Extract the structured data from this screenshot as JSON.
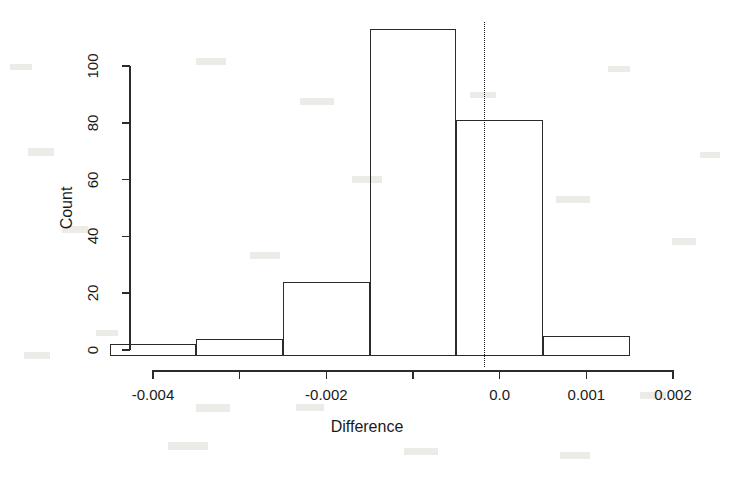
{
  "chart_data": {
    "type": "bar",
    "title": "",
    "xlabel": "Difference",
    "ylabel": "Count",
    "grid": false,
    "legend": "none",
    "xlim": [
      -0.0045,
      0.0025
    ],
    "ylim": [
      0,
      115
    ],
    "x_ticks": [
      {
        "value": -0.004,
        "label": "-0.004"
      },
      {
        "value": -0.003,
        "label": ""
      },
      {
        "value": -0.002,
        "label": "-0.002"
      },
      {
        "value": -0.001,
        "label": ""
      },
      {
        "value": 0.0,
        "label": "0.0"
      },
      {
        "value": 0.001,
        "label": "0.001"
      },
      {
        "value": 0.002,
        "label": "0.002"
      }
    ],
    "y_ticks": [
      {
        "value": 0,
        "label": "0"
      },
      {
        "value": 20,
        "label": "20"
      },
      {
        "value": 40,
        "label": "40"
      },
      {
        "value": 60,
        "label": "60"
      },
      {
        "value": 80,
        "label": "80"
      },
      {
        "value": 100,
        "label": "100"
      }
    ],
    "bins": [
      {
        "x0": -0.0045,
        "x1": -0.0035,
        "count": 2
      },
      {
        "x0": -0.0035,
        "x1": -0.0025,
        "count": 4
      },
      {
        "x0": -0.0025,
        "x1": -0.0015,
        "count": 24
      },
      {
        "x0": -0.0015,
        "x1": -0.0005,
        "count": 113
      },
      {
        "x0": -0.0005,
        "x1": 0.0005,
        "count": 81
      },
      {
        "x0": 0.0005,
        "x1": 0.0015,
        "count": 5
      }
    ],
    "categories": [
      "-0.0045 to -0.0035",
      "-0.0035 to -0.0025",
      "-0.0025 to -0.0015",
      "-0.0015 to -0.0005",
      "-0.0005 to 0.0005",
      "0.0005 to 0.0015"
    ],
    "values": [
      2,
      4,
      24,
      113,
      81,
      5
    ],
    "annotations": [
      {
        "type": "vertical-dashed-line",
        "x": -0.00018,
        "label": ""
      }
    ],
    "colors": {
      "bar_outline": "#2b2b2b",
      "bar_fill": "transparent",
      "axis": "#2b2b2b",
      "text": "#1a1a1a",
      "background": "#ffffff",
      "reference_line": "#1a1a1a"
    }
  }
}
